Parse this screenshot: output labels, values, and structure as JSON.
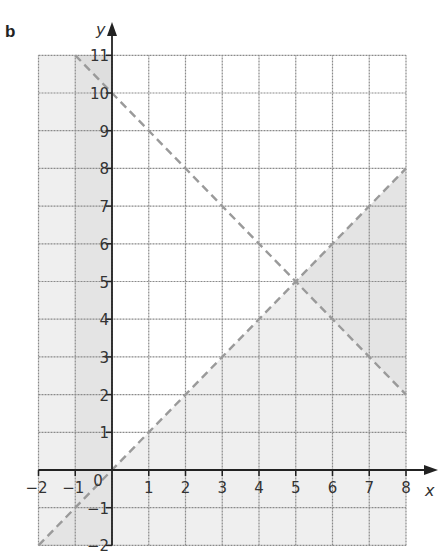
{
  "part_label": "b",
  "chart_data": {
    "type": "line",
    "title": "",
    "xlabel": "x",
    "ylabel": "y",
    "xlim": [
      -2,
      8
    ],
    "ylim": [
      -2,
      11
    ],
    "grid": true,
    "x_ticks": [
      "−2",
      "−1",
      "0",
      "1",
      "2",
      "3",
      "4",
      "5",
      "6",
      "7",
      "8"
    ],
    "y_ticks": [
      "−2",
      "−1",
      "1",
      "2",
      "3",
      "4",
      "5",
      "6",
      "7",
      "8",
      "9",
      "10",
      "11"
    ],
    "series": [
      {
        "name": "y = x",
        "style": "dashed",
        "x": [
          -2,
          8
        ],
        "y": [
          -2,
          8
        ]
      },
      {
        "name": "y = 10 − x",
        "style": "dashed",
        "x": [
          -1,
          8
        ],
        "y": [
          11,
          2
        ]
      },
      {
        "name": "x = 0",
        "style": "solid",
        "x": [
          0,
          0
        ],
        "y": [
          -2,
          11
        ]
      }
    ],
    "intersection": {
      "x": 5,
      "y": 5
    },
    "unshaded_region": "x ≥ 0 and y ≥ x (white area)",
    "shaded_regions": [
      "x < 0",
      "y < x"
    ],
    "colors": {
      "shade": "#efefef",
      "shade_dark": "#e4e4e4",
      "grid": "#8a8a8a",
      "dashed": "#9a9a9a",
      "axis": "#222222"
    }
  }
}
